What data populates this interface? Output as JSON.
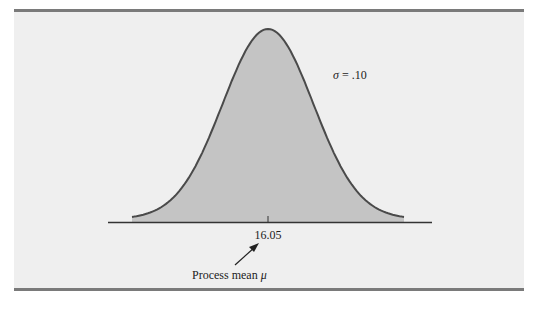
{
  "chart_data": {
    "type": "area",
    "title": "",
    "distribution": "normal",
    "mean": 16.05,
    "sigma": 0.1,
    "x_range_sigmas": [
      -3,
      3
    ],
    "tick_labels": [
      "16.05"
    ],
    "annotations": {
      "sigma_label": "σ = .10",
      "mean_label_prefix": "Process mean ",
      "mean_symbol": "μ"
    },
    "colors": {
      "fill": "#c4c4c4",
      "curve": "#4a4a4a",
      "axis": "#333333",
      "background": "#efefef"
    },
    "grid": false,
    "legend": "none"
  }
}
